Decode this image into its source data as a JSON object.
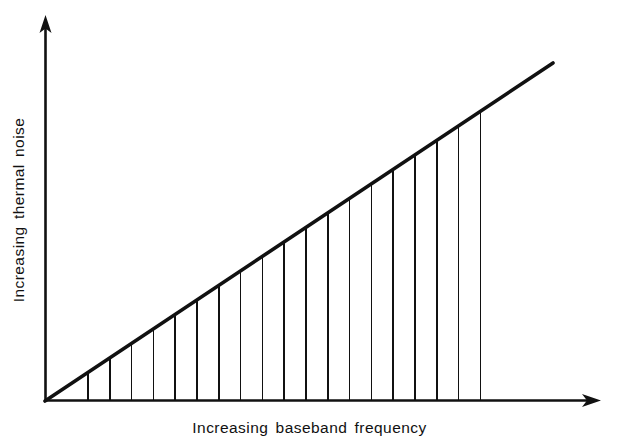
{
  "figure": {
    "name": "thermal-noise-vs-baseband-frequency",
    "background_color": "#ffffff",
    "ink_color": "#111111"
  },
  "axes": {
    "x_label": "Increasing baseband frequency",
    "y_label": "Increasing thermal noise",
    "x_axis_name": "baseband-frequency-axis",
    "y_axis_name": "thermal-noise-axis",
    "arrow_heads": "both"
  },
  "chart_data": {
    "type": "line",
    "title": "",
    "subtitle": "",
    "xlabel": "Increasing baseband frequency",
    "ylabel": "Increasing thermal noise",
    "grid": false,
    "legend": "none",
    "xlim": [
      0,
      1
    ],
    "ylim": [
      0,
      1
    ],
    "x_tick_labels": [],
    "y_tick_labels": [],
    "annotations": [],
    "series": [
      {
        "name": "thermal noise",
        "type": "line",
        "description": "Straight line of constant positive slope rising from the origin; thermal noise increases linearly with baseband frequency.",
        "x": [
          0.0,
          1.0
        ],
        "y": [
          0.0,
          1.0
        ],
        "slope": 1.0,
        "intercept": 0.0
      },
      {
        "name": "hatch fill",
        "type": "vertical-hatching",
        "description": "Area between the line and the x-axis filled with evenly spaced vertical hatch lines.",
        "count": 19,
        "x": [
          0.085,
          0.128,
          0.171,
          0.215,
          0.258,
          0.301,
          0.344,
          0.388,
          0.431,
          0.474,
          0.517,
          0.561,
          0.604,
          0.647,
          0.69,
          0.734,
          0.777,
          0.82,
          0.863
        ],
        "y": [
          0.085,
          0.128,
          0.171,
          0.215,
          0.258,
          0.301,
          0.344,
          0.388,
          0.431,
          0.474,
          0.517,
          0.561,
          0.604,
          0.647,
          0.69,
          0.734,
          0.777,
          0.82,
          0.863
        ]
      }
    ],
    "geometry_px": {
      "origin": [
        45,
        401
      ],
      "y_axis_top": [
        45,
        18
      ],
      "x_axis_right": [
        600,
        401
      ],
      "line_end": [
        553,
        63
      ],
      "hatch_first_x": 88,
      "hatch_last_x": 480,
      "hatch_spacing": 21.8
    }
  }
}
